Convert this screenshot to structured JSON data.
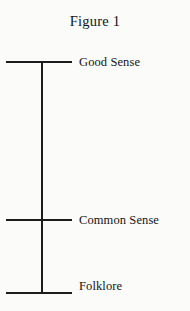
{
  "figure": {
    "title": "Figure 1",
    "background_color": "#fbfbfa",
    "line_color": "#1c1c1c",
    "text_color": "#141414"
  },
  "chart_data": {
    "type": "scale-diagram",
    "title": "Figure 1",
    "orientation": "vertical",
    "xlabel": "",
    "ylabel": "",
    "grid": false,
    "legend": null,
    "axis": {
      "top_y": 62,
      "bottom_y": 293,
      "x": 41
    },
    "categories": [
      "Good Sense",
      "Common Sense",
      "Folklore"
    ],
    "levels": [
      {
        "label": "Good Sense",
        "rank": 3,
        "position": "top",
        "tick_y": 62
      },
      {
        "label": "Common Sense",
        "rank": 2,
        "position": "middle",
        "tick_y": 220
      },
      {
        "label": "Folklore",
        "rank": 1,
        "position": "bottom",
        "tick_y": 293
      }
    ],
    "tick_extent": {
      "x_start": 6,
      "x_end": 72
    }
  }
}
